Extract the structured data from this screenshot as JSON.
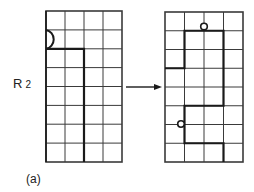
{
  "figure": {
    "row_label_main": "R",
    "row_label_sub": "2",
    "caption": "(a)"
  },
  "grids": {
    "left": {
      "cols": 4,
      "rows": 8,
      "thick_path": "from left edge at row line 2 across to column line 2, then down to bottom",
      "half_circle": "left edge, row 1"
    },
    "right": {
      "cols": 4,
      "rows": 8,
      "thick_path": "step shape: row3 from col0 to col1, up to row1, across to col3, down to row5, back to col1, down to row7, across to col3, down to bottom",
      "small_circles": [
        "top at row line 1, column line 2",
        "left at column line 1, row 6 center"
      ]
    }
  },
  "colors": {
    "line": "#333333",
    "thick_line": "#1a1a1a",
    "background": "#ffffff"
  },
  "arrow": {
    "direction": "right"
  }
}
